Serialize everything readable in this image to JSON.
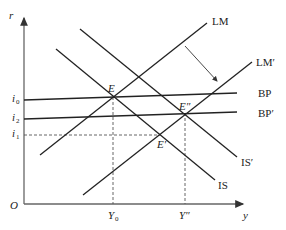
{
  "diagram": {
    "type": "economics IS-LM-BP diagram",
    "axes": {
      "y_label": "r",
      "x_label": "y",
      "origin_label": "O"
    },
    "curves": {
      "lm": "LM",
      "lm_prime": "LM′",
      "bp": "BP",
      "bp_prime": "BP′",
      "is": "IS",
      "is_prime": "IS′"
    },
    "points": {
      "e": "E",
      "e_prime": "E′",
      "e_double_prime": "E″"
    },
    "y_ticks": [
      {
        "base": "i",
        "sub": "0"
      },
      {
        "base": "i",
        "sub": "2"
      },
      {
        "base": "i",
        "sub": "1"
      }
    ],
    "x_ticks": [
      {
        "base": "Y",
        "sub": "0"
      },
      {
        "base": "Y″",
        "sub": ""
      }
    ],
    "colors": {
      "line": "#222222",
      "axis": "#555555",
      "dashed": "#555555"
    }
  }
}
